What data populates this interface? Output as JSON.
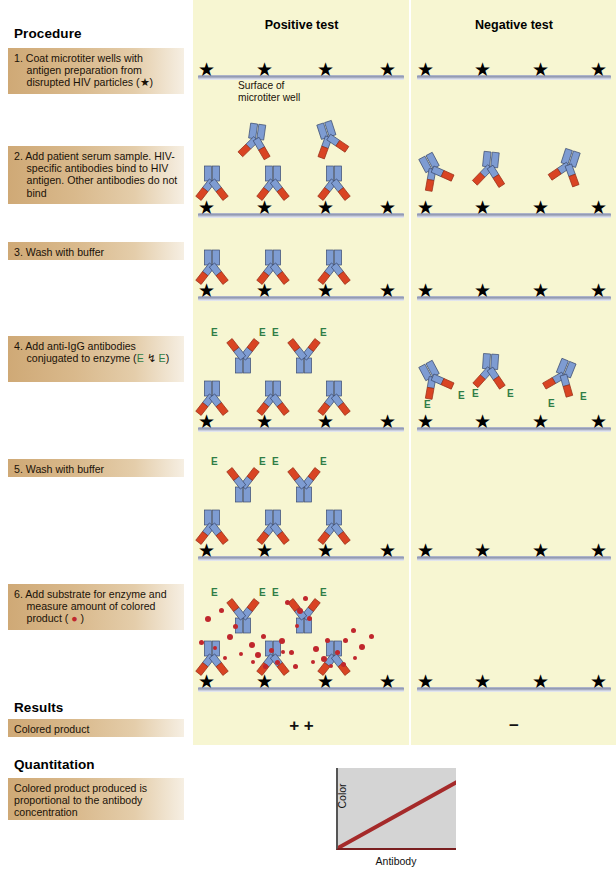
{
  "procedure": {
    "heading": "Procedure",
    "steps": [
      {
        "num": "1.",
        "text": "Coat microtiter wells with antigen preparation from disrupted HIV particles (★)"
      },
      {
        "num": "2.",
        "text": "Add patient serum sample. HIV-specific antibodies bind to HIV antigen. Other antibodies do not bind"
      },
      {
        "num": "3.",
        "text": "Wash with buffer"
      },
      {
        "num": "4.",
        "text_pre": "Add anti-IgG antibodies conjugated to enzyme (",
        "e1": "E",
        "mid": " ↯ ",
        "e2": "E",
        "text_post": ")"
      },
      {
        "num": "5.",
        "text": "Wash with buffer"
      },
      {
        "num": "6.",
        "text_pre": "Add substrate for enzyme and measure amount of colored product ( ",
        "dot": "●",
        "text_post": " )"
      }
    ]
  },
  "results": {
    "heading": "Results",
    "row_label": "Colored product",
    "positive_symbol": "+ +",
    "negative_symbol": "−"
  },
  "quantitation": {
    "heading": "Quantitation",
    "box_text": "Colored product produced is proportional to the antibody concentration"
  },
  "columns": {
    "positive": "Positive test",
    "negative": "Negative test"
  },
  "annotations": {
    "surface_note_line1": "Surface of",
    "surface_note_line2": "microtiter well",
    "enzyme_label": "E"
  },
  "colors": {
    "panel_background": "#f7f6d2",
    "step_box_start": "#cfa976",
    "step_box_end": "#f6efe3",
    "antibody_blue": "#7e9cd2",
    "antibody_red": "#d94423",
    "antigen_star": "#000000",
    "enzyme_green": "#2f7d46",
    "colored_product": "#c0272d",
    "surface_bar": "#8d95ae",
    "chart_line": "#a52a2a",
    "chart_plot_bg": "#d4d4d4"
  },
  "chart_data": {
    "type": "line",
    "title": "",
    "xlabel": "Antibody",
    "ylabel": "Color",
    "x": [
      0,
      1
    ],
    "series": [
      {
        "name": "Color vs antibody",
        "values": [
          0,
          0.82
        ]
      }
    ],
    "xlim": [
      0,
      1
    ],
    "ylim": [
      0,
      1
    ],
    "grid": false,
    "legend": "none",
    "ticks": {
      "x": [],
      "y": []
    },
    "note": "Straight positive-slope line from bottom-left origin rising to the right; axes unlabeled numerically."
  }
}
